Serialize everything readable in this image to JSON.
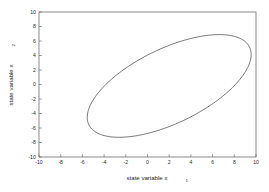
{
  "figure": {
    "background_color": "#ffffff",
    "frame_color": "#5a5a5a",
    "curve_color": "#4a4a4a",
    "x_axis_title_main": "state variable x",
    "x_axis_title_sub": "1",
    "y_axis_title_main": "state variable x",
    "y_axis_title_sub": "2"
  },
  "chart_data": {
    "type": "line",
    "title": "",
    "xlabel": "state variable x1",
    "ylabel": "state variable x2",
    "xlim": [
      -10,
      10
    ],
    "ylim": [
      -10,
      10
    ],
    "xticks": [
      -10,
      -8,
      -6,
      -4,
      -2,
      0,
      2,
      4,
      6,
      8,
      10
    ],
    "yticks": [
      -10,
      -8,
      -6,
      -4,
      -2,
      0,
      2,
      4,
      6,
      8,
      10
    ],
    "xtick_labels": [
      "-10",
      "-8",
      "-6",
      "-4",
      "-2",
      "0",
      "2",
      "4",
      "6",
      "8",
      "10"
    ],
    "ytick_labels": [
      "-10",
      "-8",
      "-6",
      "-4",
      "-2",
      "0",
      "2",
      "4",
      "6",
      "8",
      "10"
    ],
    "grid": false,
    "legend": null,
    "series": [
      {
        "name": "state trajectory",
        "shape": "closed-ellipse",
        "center": [
          2.0,
          -0.2
        ],
        "semi_major": 9.3,
        "semi_minor": 4.55,
        "rotation_deg": 42,
        "extent_x": [
          -4.1,
          8.1
        ],
        "extent_y": [
          -9.1,
          8.7
        ],
        "x": [
          8.1,
          8.02,
          7.7,
          7.16,
          6.42,
          5.5,
          4.43,
          3.26,
          2.02,
          0.76,
          -0.47,
          -1.63,
          -2.66,
          -3.5,
          -4.08,
          -4.1,
          -3.72,
          -3.06,
          -2.21,
          -1.2,
          -0.06,
          1.14,
          2.38,
          3.62,
          4.8,
          5.88,
          6.81,
          7.53,
          8.0,
          8.12,
          8.1
        ],
        "y": [
          1.2,
          2.72,
          4.15,
          5.42,
          6.5,
          7.35,
          7.95,
          8.32,
          8.45,
          8.32,
          7.92,
          7.24,
          6.28,
          5.04,
          3.15,
          1.05,
          -1.0,
          -2.82,
          -4.38,
          -5.66,
          -6.64,
          -7.35,
          -7.88,
          -8.3,
          -8.58,
          -8.55,
          -8.0,
          -6.8,
          -4.9,
          -2.52,
          1.2
        ]
      }
    ]
  }
}
